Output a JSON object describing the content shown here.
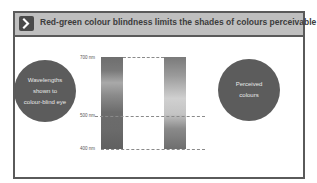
{
  "header": {
    "title": "Red-green colour blindness limits the shades of colours perceivable",
    "icon": "chevron-right-icon"
  },
  "diagram": {
    "left_circle": {
      "lines": [
        "Wavelengths",
        "shown to",
        "colour-blind eye"
      ]
    },
    "right_circle": {
      "lines": [
        "Perceived",
        "colours"
      ]
    },
    "wavelength_labels": [
      "700 nm",
      "500 nm",
      "400 nm"
    ]
  }
}
